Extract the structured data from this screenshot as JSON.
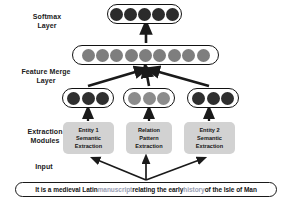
{
  "diagram": {
    "labels": {
      "softmax": "Softmax\nLayer",
      "softmax_line1": "Softmax",
      "softmax_line2": "Layer",
      "merge_line1": "Feature Merge",
      "merge_line2": "Layer",
      "modules_line1": "Extraction",
      "modules_line2": "Modules",
      "input": "Input"
    },
    "layers": {
      "softmax": {
        "name": "Softmax Layer",
        "unit_count": 5,
        "unit_color": "#2b2b2b",
        "outline_color": "#121212"
      },
      "feature_merge": {
        "name": "Feature Merge Layer",
        "unit_count": 9,
        "unit_color": "#7e7e7e",
        "outline_color": "#121212"
      },
      "module_outputs": [
        {
          "name": "entity1-output",
          "unit_count": 3,
          "unit_color": "#2f2f2f"
        },
        {
          "name": "relation-output",
          "unit_count": 3,
          "unit_color": "#8c8c8c"
        },
        {
          "name": "entity2-output",
          "unit_count": 3,
          "unit_color": "#2f2f2f"
        }
      ]
    },
    "modules": [
      {
        "id": "entity1",
        "line1": "Entity 1",
        "line2": "Semantic",
        "line3": "Extraction",
        "fill": "#d2d2d2"
      },
      {
        "id": "relation",
        "line1": "Relation",
        "line2": "Pattern",
        "line3": "Extraction",
        "fill": "#d2d2d2"
      },
      {
        "id": "entity2",
        "line1": "Entity 2",
        "line2": "Semantic",
        "line3": "Extraction",
        "fill": "#d2d2d2"
      }
    ],
    "input_sentence": {
      "full_text": "It is a medieval Latin manuscript  relating the early history of the Isle of Man",
      "tokens": [
        {
          "text": "It is a medieval Latin ",
          "highlight": false
        },
        {
          "text": "manuscript",
          "highlight": true
        },
        {
          "text": "  relating the early ",
          "highlight": false
        },
        {
          "text": "history",
          "highlight": true
        },
        {
          "text": " of the Isle of Man",
          "highlight": false
        }
      ],
      "highlight_color": "#9aa0b4",
      "text_color": "#141414"
    },
    "arrow_color": "#1a1a1a"
  }
}
